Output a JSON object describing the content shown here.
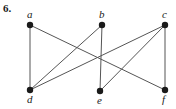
{
  "figure": {
    "exercise_number": "6.",
    "caption": "",
    "background_color": "#ffffff",
    "ink_color": "#1a1a1a",
    "edge_color": "#555555",
    "width": 176,
    "height": 109
  },
  "chart_data": {
    "type": "diagram",
    "diagram_kind": "undirected-graph",
    "title": "",
    "vertices": [
      {
        "id": "a",
        "label": "a",
        "x": 30,
        "y": 25,
        "label_x": 27,
        "label_y": 9,
        "row": "top"
      },
      {
        "id": "b",
        "label": "b",
        "x": 102,
        "y": 25,
        "label_x": 99,
        "label_y": 9,
        "row": "top"
      },
      {
        "id": "c",
        "label": "c",
        "x": 165,
        "y": 25,
        "label_x": 162,
        "label_y": 9,
        "row": "top"
      },
      {
        "id": "d",
        "label": "d",
        "x": 30,
        "y": 90,
        "label_x": 27,
        "label_y": 94,
        "row": "bottom"
      },
      {
        "id": "e",
        "label": "e",
        "x": 100,
        "y": 91,
        "label_x": 97,
        "label_y": 95,
        "row": "bottom"
      },
      {
        "id": "f",
        "label": "f",
        "x": 165,
        "y": 90,
        "label_x": 162,
        "label_y": 94,
        "row": "bottom"
      }
    ],
    "edges": [
      {
        "from": "a",
        "to": "d"
      },
      {
        "from": "a",
        "to": "f"
      },
      {
        "from": "b",
        "to": "d"
      },
      {
        "from": "b",
        "to": "e"
      },
      {
        "from": "c",
        "to": "d"
      },
      {
        "from": "c",
        "to": "e"
      },
      {
        "from": "c",
        "to": "f"
      }
    ],
    "vertex_count": 6,
    "edge_count": 7,
    "vertex_radius": 3.2,
    "edge_width": 1
  }
}
